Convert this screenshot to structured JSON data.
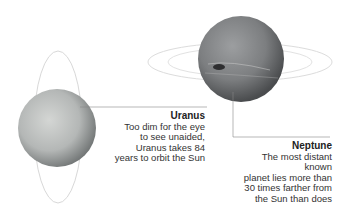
{
  "planets": [
    {
      "name": "Uranus",
      "description": "Too dim for the eye to see unaided, Uranus takes 84 years to orbit the Sun",
      "lines": [
        "Too dim for the eye",
        "to see unaided,",
        "Uranus takes 84",
        "years to orbit the Sun"
      ],
      "color": "#b8bcbc"
    },
    {
      "name": "Neptune",
      "description": "The most distant known planet lies more than 30 times farther from the Sun than does Earth",
      "lines": [
        "The most distant known",
        "planet lies more than",
        "30 times farther from",
        "the Sun than does Earth"
      ],
      "color": "#8a8c8e"
    }
  ]
}
